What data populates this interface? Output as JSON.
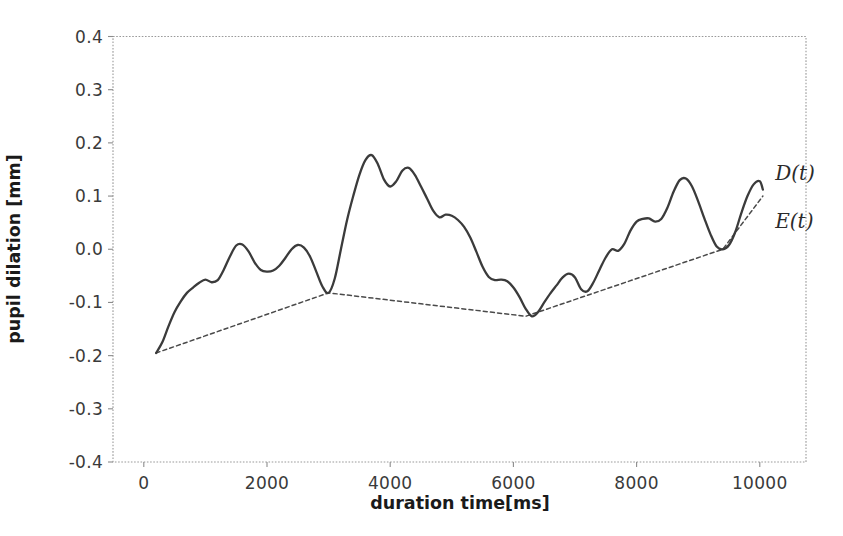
{
  "chart_data": {
    "type": "line",
    "title": "",
    "xlabel": "duration time[ms]",
    "ylabel": "pupil dilation [mm]",
    "xlim": [
      -500,
      10750
    ],
    "ylim": [
      -0.4,
      0.4
    ],
    "xticks": [
      0,
      2000,
      4000,
      6000,
      8000,
      10000
    ],
    "xtick_labels": [
      "0",
      "2000",
      "4000",
      "6000",
      "8000",
      "10000"
    ],
    "yticks": [
      -0.4,
      -0.3,
      -0.2,
      -0.1,
      0.0,
      0.1,
      0.2,
      0.3,
      0.4
    ],
    "ytick_labels": [
      "-0.4",
      "-0.3",
      "-0.2",
      "-0.1",
      "0.0",
      "0.1",
      "0.2",
      "0.3",
      "0.4"
    ],
    "grid": false,
    "legend_position": "inline-annotation",
    "annotations": [
      {
        "text": "D(t)",
        "x": 10250,
        "y": 0.145,
        "series": "D"
      },
      {
        "text": "E(t)",
        "x": 10250,
        "y": 0.055,
        "series": "E"
      }
    ],
    "series": [
      {
        "name": "D(t)",
        "label": "D(t)",
        "style": "solid",
        "color": "#3b3b3b",
        "x": [
          200,
          300,
          400,
          500,
          600,
          700,
          800,
          900,
          1000,
          1100,
          1200,
          1300,
          1400,
          1500,
          1600,
          1700,
          1800,
          1900,
          2000,
          2100,
          2200,
          2300,
          2400,
          2500,
          2600,
          2700,
          2800,
          2900,
          3000,
          3100,
          3200,
          3300,
          3400,
          3500,
          3600,
          3700,
          3800,
          3900,
          4000,
          4100,
          4200,
          4300,
          4400,
          4500,
          4600,
          4700,
          4800,
          4900,
          5000,
          5100,
          5200,
          5300,
          5400,
          5500,
          5600,
          5700,
          5800,
          5900,
          6000,
          6100,
          6200,
          6300,
          6400,
          6500,
          6600,
          6700,
          6800,
          6900,
          7000,
          7100,
          7200,
          7300,
          7400,
          7500,
          7600,
          7700,
          7800,
          7900,
          8000,
          8100,
          8200,
          8300,
          8400,
          8500,
          8600,
          8700,
          8800,
          8900,
          9000,
          9100,
          9200,
          9300,
          9400,
          9500,
          9600,
          9700,
          9800,
          9900,
          10000,
          10050
        ],
        "y": [
          -0.195,
          -0.175,
          -0.145,
          -0.118,
          -0.098,
          -0.082,
          -0.072,
          -0.063,
          -0.057,
          -0.062,
          -0.058,
          -0.038,
          -0.013,
          0.007,
          0.009,
          -0.004,
          -0.025,
          -0.039,
          -0.042,
          -0.04,
          -0.031,
          -0.016,
          0.0,
          0.008,
          0.003,
          -0.014,
          -0.042,
          -0.07,
          -0.082,
          -0.055,
          0.0,
          0.055,
          0.1,
          0.14,
          0.168,
          0.177,
          0.16,
          0.131,
          0.118,
          0.128,
          0.148,
          0.153,
          0.14,
          0.118,
          0.095,
          0.072,
          0.06,
          0.065,
          0.063,
          0.055,
          0.042,
          0.022,
          -0.005,
          -0.033,
          -0.052,
          -0.058,
          -0.057,
          -0.06,
          -0.072,
          -0.09,
          -0.112,
          -0.126,
          -0.118,
          -0.1,
          -0.083,
          -0.068,
          -0.053,
          -0.046,
          -0.053,
          -0.075,
          -0.079,
          -0.062,
          -0.038,
          -0.015,
          0.0,
          -0.003,
          0.01,
          0.035,
          0.052,
          0.057,
          0.058,
          0.052,
          0.057,
          0.078,
          0.108,
          0.13,
          0.133,
          0.118,
          0.09,
          0.058,
          0.028,
          0.005,
          0.0,
          0.008,
          0.032,
          0.068,
          0.1,
          0.122,
          0.128,
          0.112
        ]
      },
      {
        "name": "E(t)",
        "label": "E(t)",
        "style": "dashed",
        "color": "#4a4a4a",
        "x": [
          200,
          3000,
          6200,
          9400,
          10050
        ],
        "y": [
          -0.195,
          -0.082,
          -0.126,
          0.0,
          0.1
        ],
        "description": "lower envelope connecting local minima of D(t)"
      }
    ]
  },
  "axes": {
    "ylabel": "pupil dilation [mm]",
    "xlabel": "duration time[ms]"
  },
  "annotations": {
    "d_label": "D(t)",
    "e_label": "E(t)"
  },
  "colors": {
    "background": "#ffffff",
    "curve": "#3b3b3b",
    "envelope": "#4a4a4a",
    "spine": "#8c8c8c",
    "text": "#2b2b2b"
  }
}
